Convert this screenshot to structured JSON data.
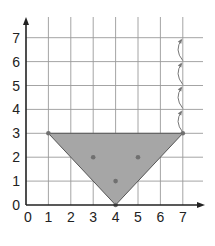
{
  "chart_data": {
    "type": "area",
    "title": "",
    "xlabel": "",
    "ylabel": "",
    "xlim": [
      0,
      7
    ],
    "ylim": [
      0,
      7
    ],
    "grid": true,
    "x_ticks": [
      "0",
      "1",
      "2",
      "3",
      "4",
      "5",
      "6",
      "7"
    ],
    "y_ticks": [
      "0",
      "1",
      "2",
      "3",
      "4",
      "5",
      "6",
      "7"
    ],
    "shape": {
      "name": "triangle",
      "vertices": [
        [
          1,
          3
        ],
        [
          7,
          3
        ],
        [
          4,
          0
        ]
      ],
      "fill": "#a6a6a6",
      "stroke": "#555555"
    },
    "points": [
      [
        1,
        3
      ],
      [
        7,
        3
      ],
      [
        4,
        0
      ],
      [
        3,
        2
      ],
      [
        5,
        2
      ],
      [
        4,
        1
      ]
    ],
    "annotations": [
      {
        "type": "curved-arrow",
        "from": [
          7,
          3
        ],
        "to": [
          7,
          4
        ]
      },
      {
        "type": "curved-arrow",
        "from": [
          7,
          4
        ],
        "to": [
          7,
          5
        ]
      },
      {
        "type": "curved-arrow",
        "from": [
          7,
          5
        ],
        "to": [
          7,
          6
        ]
      },
      {
        "type": "curved-arrow",
        "from": [
          7,
          6
        ],
        "to": [
          7,
          7
        ]
      }
    ],
    "legend": null
  },
  "colors": {
    "grid": "#9a9a9a",
    "axis": "#222222",
    "fill": "#a6a6a6",
    "point": "#707070",
    "arrow": "#777777"
  }
}
